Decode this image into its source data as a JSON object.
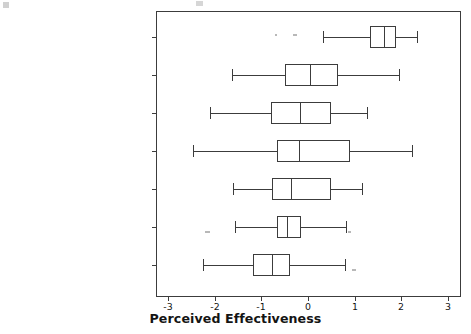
{
  "chart_data": {
    "type": "box",
    "title": "",
    "xlabel": "Perceived Effectiveness",
    "ylabel": "",
    "xlim": [
      -3.32,
      3.24
    ],
    "xticks": [
      -3,
      -2,
      -1,
      0,
      1,
      2,
      3
    ],
    "xtick_labels": [
      "-3",
      "-2",
      "-1",
      "0",
      "1",
      "2",
      "3"
    ],
    "grid": false,
    "legend": null,
    "orientation": "horizontal",
    "categories": [
      "Western Europe/North America",
      "Latin America/Caribbean",
      "Middle East/North Africa",
      "East Asia/Pacific",
      "Eastern Europe/Central Asia",
      "South Asia",
      "Sub-Saharan Africa"
    ],
    "boxes": [
      {
        "category": "Western Europe/North America",
        "whisker_low": 0.32,
        "q1": 1.34,
        "median": 1.64,
        "q3": 1.89,
        "whisker_high": 2.34
      },
      {
        "category": "Latin America/Caribbean",
        "whisker_low": -1.64,
        "q1": -0.49,
        "median": 0.04,
        "q3": 0.64,
        "whisker_high": 1.96
      },
      {
        "category": "Middle East/North Africa",
        "whisker_low": -2.11,
        "q1": -0.79,
        "median": -0.17,
        "q3": 0.49,
        "whisker_high": 1.26
      },
      {
        "category": "East Asia/Pacific",
        "whisker_low": -2.47,
        "q1": -0.66,
        "median": -0.19,
        "q3": 0.91,
        "whisker_high": 2.23
      },
      {
        "category": "Eastern Europe/Central Asia",
        "whisker_low": -1.62,
        "q1": -0.77,
        "median": -0.36,
        "q3": 0.49,
        "whisker_high": 1.15
      },
      {
        "category": "South Asia",
        "whisker_low": -1.57,
        "q1": -0.66,
        "median": -0.45,
        "q3": -0.15,
        "whisker_high": 0.81
      },
      {
        "category": "Sub-Saharan Africa",
        "whisker_low": -2.26,
        "q1": -1.19,
        "median": -0.77,
        "q3": -0.38,
        "whisker_high": 0.79
      }
    ]
  },
  "colors": {
    "line": "#3c3c3c",
    "text": "#141414",
    "background": "#ffffff"
  }
}
